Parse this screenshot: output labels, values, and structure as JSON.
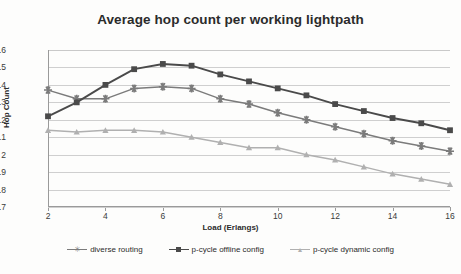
{
  "chart_data": {
    "type": "line",
    "title": "Average hop count per working lightpath",
    "xlabel": "Load (Erlangs)",
    "ylabel": "Hop Count",
    "x": [
      2,
      3,
      4,
      5,
      6,
      7,
      8,
      9,
      10,
      11,
      12,
      13,
      14,
      15,
      16
    ],
    "xlim": [
      2,
      16
    ],
    "ylim": [
      1.7,
      2.6
    ],
    "xticks": [
      2,
      4,
      6,
      8,
      10,
      12,
      14,
      16
    ],
    "xtick_labels": [
      "2",
      "4",
      "6",
      "8",
      "10",
      "12",
      "14",
      "16"
    ],
    "yticks": [
      1.7,
      1.8,
      1.9,
      2.0,
      2.1,
      2.2,
      2.3,
      2.4,
      2.5,
      2.6
    ],
    "ytick_labels": [
      "1.7",
      "1.8",
      "1.9",
      "2",
      "2.1",
      "2.2",
      "2.3",
      "2.4",
      "2.5",
      "2.6"
    ],
    "grid": true,
    "legend_position": "bottom",
    "series": [
      {
        "name": "diverse routing",
        "marker": "star",
        "color": "#7b7b7b",
        "values": [
          2.37,
          2.32,
          2.32,
          2.38,
          2.39,
          2.38,
          2.32,
          2.29,
          2.24,
          2.2,
          2.16,
          2.12,
          2.08,
          2.05,
          2.02
        ]
      },
      {
        "name": "p-cycle offline config",
        "marker": "square",
        "color": "#4a4a4a",
        "values": [
          2.22,
          2.3,
          2.4,
          2.49,
          2.52,
          2.51,
          2.46,
          2.42,
          2.38,
          2.34,
          2.29,
          2.25,
          2.21,
          2.18,
          2.14
        ]
      },
      {
        "name": "p-cycle dynamic config",
        "marker": "triangle",
        "color": "#b0b0b0",
        "values": [
          2.14,
          2.13,
          2.14,
          2.14,
          2.13,
          2.1,
          2.07,
          2.04,
          2.04,
          2.0,
          1.97,
          1.93,
          1.89,
          1.86,
          1.83
        ]
      }
    ]
  },
  "colors": {
    "background": "#fdfdfc",
    "grid": "#cfcfcf",
    "axis": "#9a9a9a",
    "text": "#2b2b2b",
    "series_diverse_routing": "#7b7b7b",
    "series_pcycle_offline": "#4a4a4a",
    "series_pcycle_dynamic": "#b0b0b0"
  }
}
